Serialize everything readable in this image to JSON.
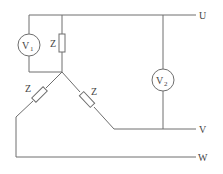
{
  "diagram": {
    "type": "three-phase star (Y) load circuit with voltmeters",
    "terminals": {
      "u": "U",
      "v": "V",
      "w": "W"
    },
    "voltmeters": {
      "v1": {
        "symbol": "V",
        "subscript": "1"
      },
      "v2": {
        "symbol": "V",
        "subscript": "2"
      }
    },
    "impedances": {
      "top": "Z",
      "left": "Z",
      "right": "Z"
    },
    "colors": {
      "wire": "#6e6e6e",
      "text": "#444444",
      "background": "#ffffff"
    }
  }
}
